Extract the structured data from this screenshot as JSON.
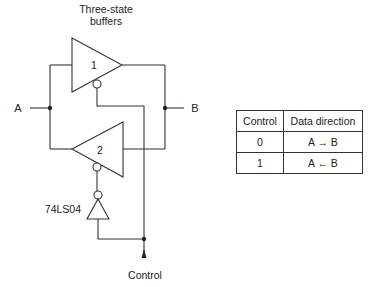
{
  "diagram": {
    "title_line1": "Three-state",
    "title_line2": "buffers",
    "buffers": [
      {
        "id": "1",
        "label": "1",
        "direction": "A to B"
      },
      {
        "id": "2",
        "label": "2",
        "direction": "B to A"
      }
    ],
    "inverter_label": "74LS04",
    "node_a_label": "A",
    "node_b_label": "B",
    "control_label": "Control"
  },
  "truth_table": {
    "headers": [
      "Control",
      "Data direction"
    ],
    "rows": [
      {
        "control": "0",
        "direction": "A → B"
      },
      {
        "control": "1",
        "direction": "A ← B"
      }
    ]
  },
  "colors": {
    "line": "#333333",
    "text": "#222222",
    "background": "#ffffff"
  }
}
